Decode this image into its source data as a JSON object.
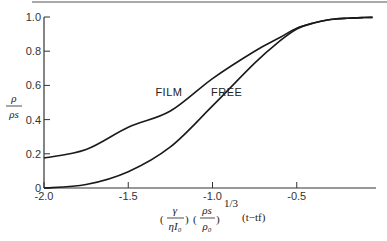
{
  "chart_data": {
    "type": "line",
    "title": "",
    "xlabel": "(γ/ηI₀)(ρs/ρ₀)^(1/3)(t−tf)",
    "ylabel": "ρ/ρs",
    "xlim": [
      -2.0,
      0.0
    ],
    "ylim": [
      0.0,
      1.0
    ],
    "grid": false,
    "x_ticks": [
      -2.0,
      -1.5,
      -1.0,
      -0.5
    ],
    "x_tick_labels": [
      "-2.0",
      "-1.5",
      "-1.0",
      "-0.5"
    ],
    "y_ticks": [
      0,
      0.2,
      0.4,
      0.6,
      0.8,
      1.0
    ],
    "y_tick_labels": [
      "0",
      "0.2",
      "0.4",
      "0.6",
      "0.8",
      "1.0"
    ],
    "series": [
      {
        "name": "FILM",
        "x": [
          -2.0,
          -1.75,
          -1.5,
          -1.25,
          -1.0,
          -0.75,
          -0.6,
          -0.5,
          -0.4,
          -0.3,
          -0.2,
          -0.1,
          -0.05
        ],
        "y": [
          0.175,
          0.225,
          0.355,
          0.45,
          0.64,
          0.8,
          0.88,
          0.935,
          0.965,
          0.985,
          0.993,
          0.997,
          0.998
        ]
      },
      {
        "name": "FREE",
        "x": [
          -2.0,
          -1.75,
          -1.5,
          -1.25,
          -1.0,
          -0.75,
          -0.6,
          -0.5,
          -0.4,
          -0.3,
          -0.2,
          -0.1,
          -0.05
        ],
        "y": [
          0.0,
          0.02,
          0.095,
          0.24,
          0.48,
          0.73,
          0.86,
          0.93,
          0.965,
          0.985,
          0.993,
          0.997,
          0.998
        ]
      }
    ],
    "annotations": [
      {
        "text": "FILM",
        "x": -1.25,
        "y": 0.56
      },
      {
        "text": "FREE",
        "x": -0.92,
        "y": 0.56
      }
    ]
  },
  "labels": {
    "ylabel_num": "ρ",
    "ylabel_den": "ρs",
    "x_gamma": "γ",
    "x_eta": "ηI₀",
    "x_rho_s": "ρs",
    "x_rho_0": "ρ₀",
    "x_exp": "1/3",
    "x_time": "(t−tf)"
  }
}
